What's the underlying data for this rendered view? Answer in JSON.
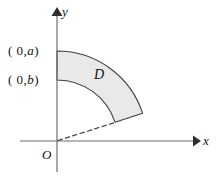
{
  "figure": {
    "title": "",
    "labels": {
      "point_a": {
        "prefix": "( 0,",
        "var": "a",
        "suffix": ")"
      },
      "point_b": {
        "prefix": "( 0,",
        "var": "b",
        "suffix": ")"
      },
      "axis_x": "x",
      "axis_y": "y",
      "region": "D",
      "origin": "O"
    },
    "colors": {
      "stroke": "#3b3b3b",
      "fill": "#e8e8e8",
      "axis": "#6b6b6b",
      "text": "#111111",
      "background": "#ffffff"
    },
    "geometry": {
      "origin_x": 57,
      "origin_y": 141,
      "inner_radius": 61,
      "outer_radius": 90,
      "start_angle_deg": 90,
      "end_angle_deg": 18,
      "x_axis_start_x": 20,
      "x_axis_end_x": 200,
      "y_axis_top_y": 8,
      "y_axis_bottom_y": 172,
      "inner_arc_y_intercept": 80,
      "outer_arc_y_intercept": 51,
      "cut_inner_point": [
        115,
        122
      ],
      "cut_outer_point": [
        143,
        113
      ]
    }
  }
}
